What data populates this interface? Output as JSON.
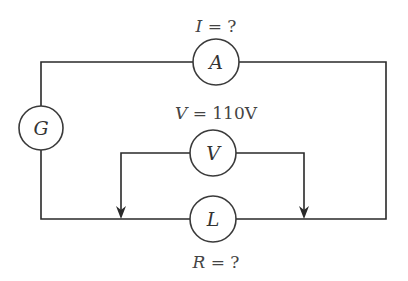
{
  "diagram": {
    "type": "electric-circuit",
    "components": {
      "ammeter": {
        "symbol": "A",
        "label_var": "I",
        "label_rest": " = ?"
      },
      "voltmeter": {
        "symbol": "V",
        "label_var": "V",
        "label_rest": " = 110V"
      },
      "load": {
        "symbol": "L",
        "label_var": "R",
        "label_rest": " = ?"
      },
      "generator": {
        "symbol": "G"
      }
    },
    "colors": {
      "wire": "#2a2a2a",
      "background": "#ffffff"
    }
  }
}
